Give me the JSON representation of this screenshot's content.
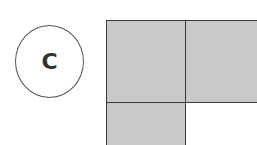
{
  "option": {
    "label": "C"
  },
  "figure": {
    "fill_color": "#c9c9c9",
    "border_color": "#3a3a3a",
    "cells": [
      {
        "name": "cell-top-left",
        "left": 106,
        "top": 20,
        "width": 80,
        "height": 83
      },
      {
        "name": "cell-top-right",
        "left": 185,
        "top": 20,
        "width": 80,
        "height": 83
      },
      {
        "name": "cell-bottom-left",
        "left": 106,
        "top": 102,
        "width": 80,
        "height": 60
      }
    ]
  }
}
